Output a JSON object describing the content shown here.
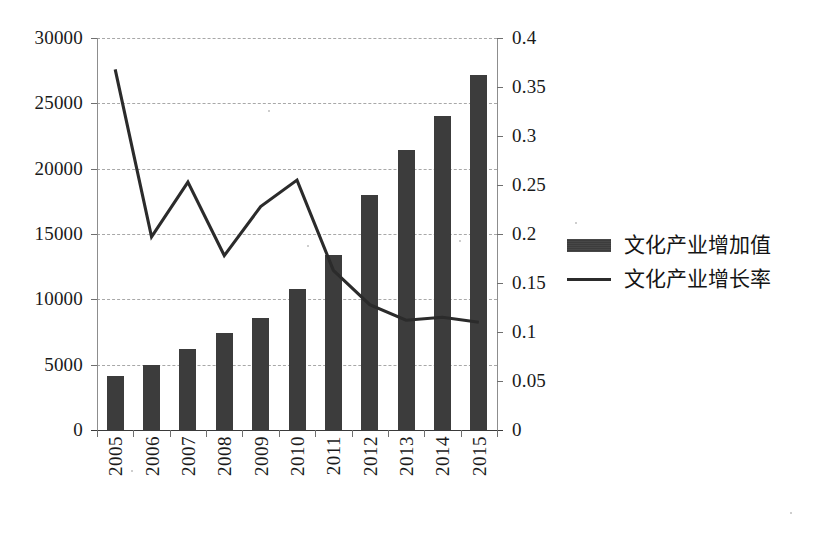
{
  "chart_data": {
    "type": "bar",
    "title": "",
    "subtitle": "",
    "xlabel": "",
    "ylabel": "",
    "grid": true,
    "legend_position": "right",
    "categories": [
      "2005",
      "2006",
      "2007",
      "2008",
      "2009",
      "2010",
      "2011",
      "2012",
      "2013",
      "2014",
      "2015"
    ],
    "axes": {
      "left": {
        "label": "",
        "min": 0,
        "max": 30000,
        "step": 5000,
        "ticks": [
          "0",
          "5000",
          "10000",
          "15000",
          "20000",
          "25000",
          "30000"
        ],
        "tick_values": [
          0,
          5000,
          10000,
          15000,
          20000,
          25000,
          30000
        ]
      },
      "right": {
        "label": "",
        "min": 0,
        "max": 0.4,
        "step": 0.05,
        "ticks": [
          "0",
          "0.05",
          "0.1",
          "0.15",
          "0.2",
          "0.25",
          "0.3",
          "0.35",
          "0.4"
        ],
        "tick_values": [
          0,
          0.05,
          0.1,
          0.15,
          0.2,
          0.25,
          0.3,
          0.35,
          0.4
        ]
      }
    },
    "series": [
      {
        "name": "文化产业增加值",
        "type": "bar",
        "axis": "left",
        "color": "#3c3c3c",
        "values": [
          4100,
          5000,
          6200,
          7400,
          8600,
          10800,
          13400,
          18000,
          21400,
          24000,
          27200
        ]
      },
      {
        "name": "文化产业增长率",
        "type": "line",
        "axis": "right",
        "color": "#2b2b2b",
        "values": [
          0.368,
          0.197,
          0.253,
          0.178,
          0.228,
          0.255,
          0.163,
          0.128,
          0.112,
          0.115,
          0.11
        ]
      }
    ]
  },
  "legend": {
    "items": [
      {
        "label": "文化产业增加值",
        "key": "bar-swatch"
      },
      {
        "label": "文化产业增长率",
        "key": "line-swatch"
      }
    ]
  }
}
